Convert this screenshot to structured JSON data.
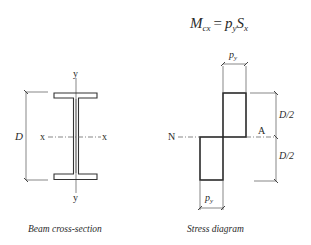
{
  "formula": {
    "lhs_main": "M",
    "lhs_sub": "cx",
    "equals": "=",
    "rhs_p": "p",
    "rhs_p_sub": "y",
    "rhs_s": "S",
    "rhs_s_sub": "x"
  },
  "beam": {
    "axis_y_top": "y",
    "axis_y_bottom": "y",
    "axis_x_left": "x",
    "axis_x_right": "x",
    "depth_label": "D",
    "caption": "Beam cross-section"
  },
  "stress": {
    "top_width_label_p": "p",
    "top_width_label_sub": "y",
    "bottom_width_label_p": "p",
    "bottom_width_label_sub": "y",
    "neutral_left": "N",
    "neutral_right": "A",
    "upper_depth": "D/2",
    "lower_depth": "D/2",
    "caption": "Stress diagram"
  }
}
